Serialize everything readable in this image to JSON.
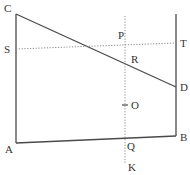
{
  "diagram": {
    "points": {
      "A": {
        "label": "A",
        "x": 16,
        "y": 143
      },
      "B": {
        "label": "B",
        "x": 176,
        "y": 136
      },
      "C": {
        "label": "C",
        "x": 16,
        "y": 14
      },
      "D": {
        "label": "D",
        "x": 176,
        "y": 87
      },
      "S": {
        "label": "S",
        "x": 16,
        "y": 49
      },
      "T": {
        "label": "T",
        "x": 176,
        "y": 43
      },
      "P": {
        "label": "P",
        "x": 125,
        "y": 44
      },
      "R": {
        "label": "R",
        "x": 125,
        "y": 63
      },
      "O": {
        "label": "O",
        "x": 125,
        "y": 105
      },
      "Q": {
        "label": "Q",
        "x": 125,
        "y": 138
      },
      "K": {
        "label": "K",
        "x": 125,
        "y": 163
      }
    },
    "right_line_top_y": 14,
    "vertical_dotted_top_y": 16,
    "colors": {
      "line": "#4a4a4a",
      "dotted": "#8a8a8a",
      "text": "#333333"
    }
  }
}
